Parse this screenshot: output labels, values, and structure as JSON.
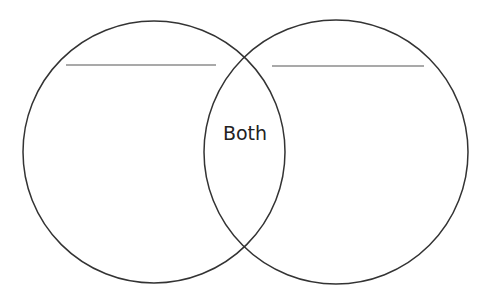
{
  "diagram": {
    "type": "venn",
    "circles": [
      {
        "name": "left",
        "cx": 154,
        "cy": 152,
        "r": 131,
        "label": ""
      },
      {
        "name": "right",
        "cx": 336,
        "cy": 152,
        "r": 132,
        "label": ""
      }
    ],
    "overlap_label": "Both",
    "blank_lines": [
      {
        "name": "left",
        "x1": 66,
        "x2": 216,
        "y": 65
      },
      {
        "name": "right",
        "x1": 272,
        "x2": 424,
        "y": 66
      }
    ],
    "colors": {
      "stroke": "#333333",
      "line": "#555555",
      "text": "#222222",
      "background": "#ffffff"
    }
  }
}
